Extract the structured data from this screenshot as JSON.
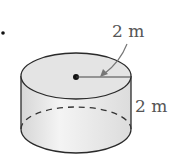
{
  "diagram": {
    "type": "cylinder",
    "radius_label": "2 m",
    "height_label": "2 m",
    "colors": {
      "outline": "#2a2a2a",
      "fill_top": "#e4e4e4",
      "fill_side": "#ececec",
      "label": "#555555",
      "arrow": "#777777"
    }
  }
}
